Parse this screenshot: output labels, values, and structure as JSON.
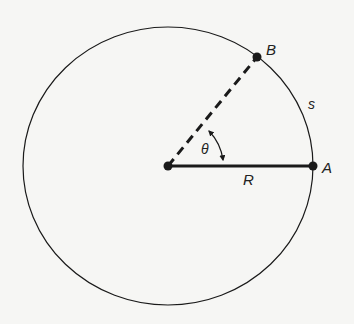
{
  "diagram": {
    "type": "circle-arc-length",
    "colors": {
      "background": "#f6f6f4",
      "stroke": "#1a1a1a"
    },
    "circle": {
      "cx": 168,
      "cy": 166,
      "rx": 145,
      "ry": 139
    },
    "points": {
      "center": {
        "x": 168,
        "y": 166
      },
      "A": {
        "x": 313,
        "y": 166,
        "label": "A"
      },
      "B": {
        "x": 257,
        "y": 57,
        "label": "B"
      }
    },
    "labels": {
      "point_a": "A",
      "point_b": "B",
      "arc": "s",
      "radius": "R",
      "angle": "θ"
    }
  }
}
